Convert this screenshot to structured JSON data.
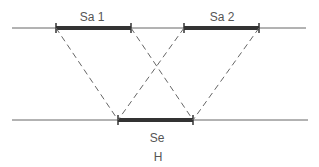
{
  "diagram": {
    "labels": {
      "segment_top_1": "Sa 1",
      "segment_top_2": "Sa 2",
      "segment_bottom": "Se",
      "bottom_caption": "H"
    },
    "colors": {
      "thin_line": "#555555",
      "thick_bar": "#333333",
      "dashed": "#666666",
      "text": "#555555"
    }
  }
}
